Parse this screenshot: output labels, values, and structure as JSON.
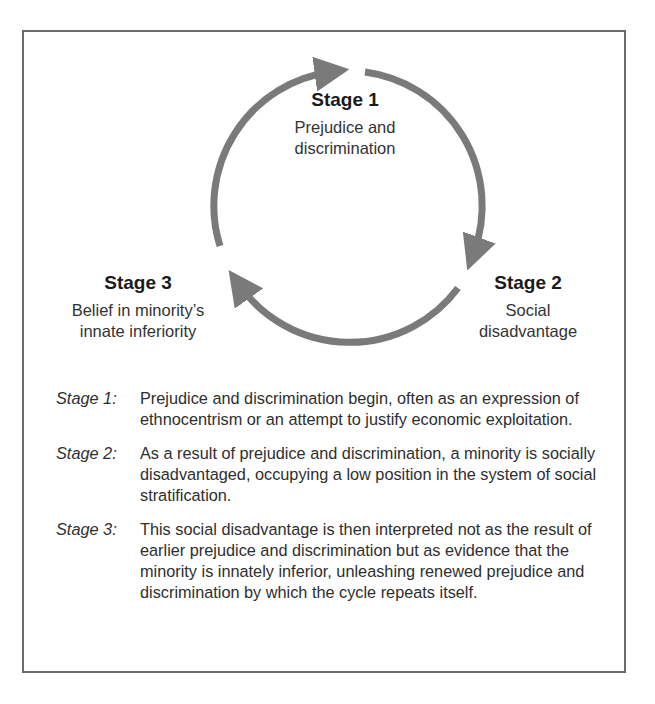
{
  "diagram": {
    "type": "cycle",
    "colors": {
      "arrow": "#7a7a7a",
      "border": "#6a6a6a",
      "text": "#2a2a2a"
    },
    "stages": [
      {
        "title": "Stage 1",
        "description_lines": [
          "Prejudice and",
          "discrimination"
        ]
      },
      {
        "title": "Stage 2",
        "description_lines": [
          "Social",
          "disadvantage"
        ]
      },
      {
        "title": "Stage 3",
        "description_lines": [
          "Belief in minority’s",
          "innate inferiority"
        ]
      }
    ],
    "arrows": [
      {
        "from": "Stage 3",
        "to": "Stage 1",
        "icon": "arrow-clockwise-icon"
      },
      {
        "from": "Stage 1",
        "to": "Stage 2",
        "icon": "arrow-clockwise-icon"
      },
      {
        "from": "Stage 2",
        "to": "Stage 3",
        "icon": "arrow-clockwise-icon"
      }
    ]
  },
  "notes": [
    {
      "key": "Stage 1:",
      "text": "Prejudice and discrimination begin, often as an expression of ethnocentrism or an attempt to justify economic exploitation."
    },
    {
      "key": "Stage 2:",
      "text": "As a result of prejudice and discrimination, a minority is socially disadvantaged, occupying a low position in the system of social stratification."
    },
    {
      "key": "Stage 3:",
      "text": "This social disadvantage is then interpreted not as the result of earlier prejudice and discrimination but as evidence that the minority is innately inferior, unleashing renewed prejudice and discrimination by which the cycle repeats itself."
    }
  ]
}
